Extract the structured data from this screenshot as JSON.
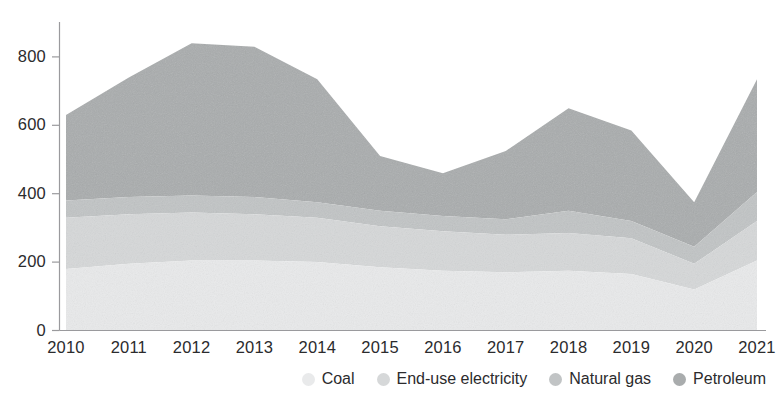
{
  "title_fragment": "",
  "axis": {
    "y_ticks": [
      "0",
      "200",
      "400",
      "600",
      "800"
    ],
    "x_ticks": [
      "2010",
      "2011",
      "2012",
      "2013",
      "2014",
      "2015",
      "2016",
      "2017",
      "2018",
      "2019",
      "2020",
      "2021"
    ]
  },
  "legend": {
    "items": [
      {
        "label": "Coal",
        "color": "#e9eaeb"
      },
      {
        "label": "End-use electricity",
        "color": "#d6d8d9"
      },
      {
        "label": "Natural gas",
        "color": "#c1c4c5"
      },
      {
        "label": "Petroleum",
        "color": "#a9acad"
      }
    ]
  },
  "chart_data": {
    "type": "area",
    "stacked": true,
    "title": "",
    "xlabel": "",
    "ylabel": "",
    "ylim": [
      0,
      850
    ],
    "grid": false,
    "legend_position": "bottom-right",
    "categories": [
      "2010",
      "2011",
      "2012",
      "2013",
      "2014",
      "2015",
      "2016",
      "2017",
      "2018",
      "2019",
      "2020",
      "2021"
    ],
    "series": [
      {
        "name": "Coal",
        "color": "#e9eaeb",
        "values": [
          180,
          195,
          205,
          205,
          200,
          185,
          175,
          170,
          175,
          165,
          120,
          205
        ]
      },
      {
        "name": "End-use electricity",
        "color": "#d6d8d9",
        "values": [
          150,
          145,
          140,
          135,
          130,
          120,
          115,
          110,
          110,
          105,
          75,
          115
        ]
      },
      {
        "name": "Natural gas",
        "color": "#c1c4c5",
        "values": [
          50,
          50,
          50,
          50,
          45,
          45,
          45,
          45,
          65,
          50,
          50,
          85
        ]
      },
      {
        "name": "Petroleum",
        "color": "#a9acad",
        "values": [
          250,
          350,
          445,
          440,
          360,
          160,
          125,
          200,
          300,
          265,
          130,
          330
        ]
      }
    ],
    "totals": [
      630,
      740,
      840,
      830,
      735,
      510,
      460,
      525,
      650,
      585,
      375,
      735
    ]
  }
}
